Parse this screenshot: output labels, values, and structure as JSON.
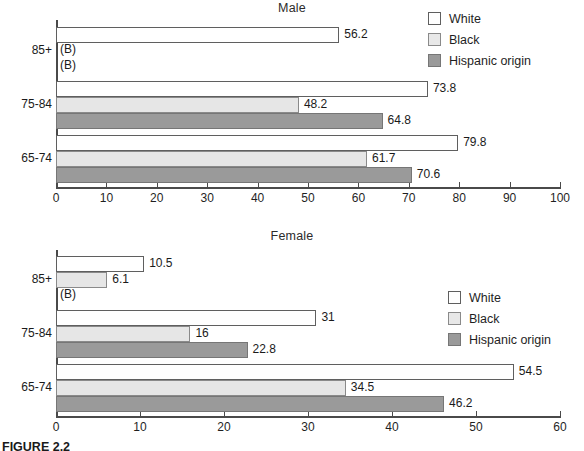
{
  "figure": {
    "caption": "FIGURE 2.2"
  },
  "legend": {
    "entries": [
      {
        "label": "White",
        "color": "#ffffff",
        "swatch": "white"
      },
      {
        "label": "Black",
        "color": "#e6e6e6",
        "swatch": "black"
      },
      {
        "label": "Hispanic origin",
        "color": "#9a9a9a",
        "swatch": "hispanic"
      }
    ]
  },
  "suppressed_marker": "(B)",
  "chart_data": [
    {
      "type": "bar",
      "orientation": "horizontal",
      "title": "Male",
      "xlabel": "",
      "ylabel": "",
      "xlim": [
        0,
        100
      ],
      "xticks": [
        0,
        10,
        20,
        30,
        40,
        50,
        60,
        70,
        80,
        90,
        100
      ],
      "xtick_labels": [
        "0",
        "10",
        "20",
        "30",
        "40",
        "50",
        "60",
        "70",
        "80",
        "90",
        "100"
      ],
      "categories": [
        "85+",
        "75-84",
        "65-74"
      ],
      "grid": false,
      "legend_position": "top-right",
      "series": [
        {
          "name": "White",
          "values": [
            56.2,
            73.8,
            79.8
          ],
          "labels": [
            "56.2",
            "73.8",
            "79.8"
          ],
          "color": "#ffffff"
        },
        {
          "name": "Black",
          "values": [
            null,
            48.2,
            61.7
          ],
          "labels": [
            "(B)",
            "48.2",
            "61.7"
          ],
          "color": "#e6e6e6"
        },
        {
          "name": "Hispanic origin",
          "values": [
            null,
            64.8,
            70.6
          ],
          "labels": [
            "(B)",
            "64.8",
            "70.6"
          ],
          "color": "#9a9a9a"
        }
      ]
    },
    {
      "type": "bar",
      "orientation": "horizontal",
      "title": "Female",
      "xlabel": "",
      "ylabel": "",
      "xlim": [
        0,
        60
      ],
      "xticks": [
        0,
        10,
        20,
        30,
        40,
        50,
        60
      ],
      "xtick_labels": [
        "0",
        "10",
        "20",
        "30",
        "40",
        "50",
        "60"
      ],
      "categories": [
        "85+",
        "75-84",
        "65-74"
      ],
      "grid": false,
      "legend_position": "right",
      "series": [
        {
          "name": "White",
          "values": [
            10.5,
            31,
            54.5
          ],
          "labels": [
            "10.5",
            "31",
            "54.5"
          ],
          "color": "#ffffff"
        },
        {
          "name": "Black",
          "values": [
            6.1,
            16,
            34.5
          ],
          "labels": [
            "6.1",
            "16",
            "34.5"
          ],
          "color": "#e6e6e6"
        },
        {
          "name": "Hispanic origin",
          "values": [
            null,
            22.8,
            46.2
          ],
          "labels": [
            "(B)",
            "22.8",
            "46.2"
          ],
          "color": "#9a9a9a"
        }
      ]
    }
  ]
}
